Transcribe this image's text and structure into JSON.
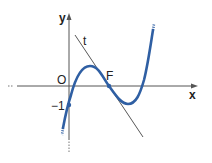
{
  "diagram": {
    "axes": {
      "x_label": "x",
      "y_label": "y",
      "origin_label": "O"
    },
    "labels": {
      "tangent": "t",
      "inflection_point": "F",
      "y_intercept": "−1"
    },
    "colors": {
      "curve": "#2f5fa3",
      "axis": "#555555",
      "tangent": "#444444",
      "background": "#ffffff"
    }
  }
}
